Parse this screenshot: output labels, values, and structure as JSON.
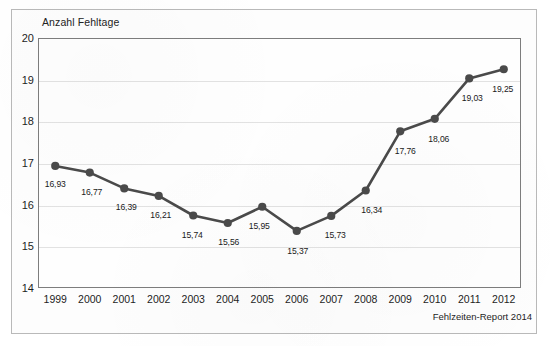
{
  "chart_data": {
    "type": "line",
    "title": "Anzahl Fehltage",
    "xlabel": "",
    "ylabel": "Anzahl Fehltage",
    "categories": [
      "1999",
      "2000",
      "2001",
      "2002",
      "2003",
      "2004",
      "2005",
      "2006",
      "2007",
      "2008",
      "2009",
      "2010",
      "2011",
      "2012"
    ],
    "values": [
      16.93,
      16.77,
      16.39,
      16.21,
      15.74,
      15.56,
      15.95,
      15.37,
      15.73,
      16.34,
      17.76,
      18.06,
      19.03,
      19.25
    ],
    "value_labels": [
      "16,93",
      "16,77",
      "16,39",
      "16,21",
      "15,74",
      "15,56",
      "15,95",
      "15,37",
      "15,73",
      "16,34",
      "17,76",
      "18,06",
      "19,03",
      "19,25"
    ],
    "ylim": [
      14,
      20
    ],
    "yticks": [
      20,
      19,
      18,
      17,
      16,
      15,
      14
    ],
    "ytick_labels": [
      "20",
      "19",
      "18",
      "17",
      "16",
      "15",
      "14"
    ],
    "grid": true,
    "legend": false,
    "series_color": "#4a4a4a",
    "grid_color": "#e2e2e2",
    "axis_color": "#7d7d7d",
    "label_positions": [
      {
        "dx": 0,
        "dy": 13,
        "anchor": "below"
      },
      {
        "dx": 2,
        "dy": 14,
        "anchor": "below"
      },
      {
        "dx": 2,
        "dy": 14,
        "anchor": "below"
      },
      {
        "dx": 2,
        "dy": 14,
        "anchor": "below"
      },
      {
        "dx": -1,
        "dy": 14,
        "anchor": "below"
      },
      {
        "dx": 1,
        "dy": 14,
        "anchor": "below"
      },
      {
        "dx": -3,
        "dy": 14,
        "anchor": "below-left"
      },
      {
        "dx": 1,
        "dy": 15,
        "anchor": "below"
      },
      {
        "dx": 4,
        "dy": 14,
        "anchor": "below-right"
      },
      {
        "dx": 6,
        "dy": 14,
        "anchor": "below-right"
      },
      {
        "dx": 5,
        "dy": 15,
        "anchor": "below-right"
      },
      {
        "dx": 4,
        "dy": 15,
        "anchor": "below-right"
      },
      {
        "dx": 3,
        "dy": 15,
        "anchor": "below-right"
      },
      {
        "dx": -1,
        "dy": 15,
        "anchor": "below-left"
      }
    ]
  },
  "footer": {
    "source": "Fehlzeiten-Report 2014"
  }
}
